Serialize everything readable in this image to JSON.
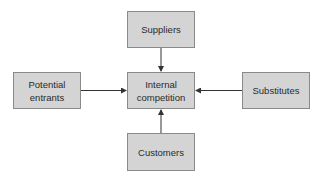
{
  "diagram": {
    "title": "",
    "nodes": {
      "center": {
        "label": "Internal competition",
        "lines": [
          "Internal",
          "competition"
        ]
      },
      "top": {
        "label": "Suppliers"
      },
      "left": {
        "label": "Potential entrants",
        "lines": [
          "Potential",
          "entrants"
        ]
      },
      "right": {
        "label": "Substitutes"
      },
      "bottom": {
        "label": "Customers"
      }
    },
    "edges": [
      {
        "from": "Suppliers",
        "to": "Internal competition"
      },
      {
        "from": "Potential entrants",
        "to": "Internal competition"
      },
      {
        "from": "Substitutes",
        "to": "Internal competition"
      },
      {
        "from": "Customers",
        "to": "Internal competition"
      }
    ],
    "colors": {
      "box_fill": "#d4d4d4",
      "box_border": "#8a8a8a",
      "arrow": "#333333",
      "text": "#2a2a2a"
    }
  }
}
